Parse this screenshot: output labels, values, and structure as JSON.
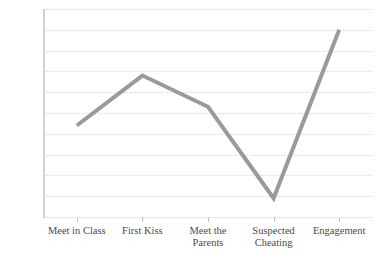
{
  "chart_data": {
    "type": "line",
    "title": "",
    "xlabel": "",
    "ylabel": "",
    "categories": [
      "Meet in Class",
      "First Kiss",
      "Meet the\nParents",
      "Suspected\nCheating",
      "Engagement"
    ],
    "values": [
      2.2,
      3.4,
      2.65,
      0.45,
      4.5
    ],
    "series": [
      {
        "name": "",
        "values": [
          2.2,
          3.4,
          2.65,
          0.45,
          4.5
        ]
      }
    ],
    "ylim": [
      0,
      5.0
    ],
    "y_ticks": [
      0,
      0.5,
      1.0,
      1.5,
      2.0,
      2.5,
      3.0,
      3.5,
      4.0,
      4.5,
      5.0
    ],
    "y_tick_labels": [
      "0",
      "0.5",
      "1.0",
      "1.5",
      "2.0",
      "2.5",
      "3.0",
      "3.5",
      "4.0",
      "4.5",
      "5.0"
    ],
    "grid": true,
    "grid_style": "dotted",
    "grid_axis": "y",
    "legend": false,
    "legend_position": "none",
    "markers": false,
    "line_color": "#9a9a9a",
    "line_width": 4,
    "grid_color": "#d9d9d9",
    "axis_color": "#d2d2d2",
    "text_color": "#555555",
    "background": "#ffffff"
  }
}
